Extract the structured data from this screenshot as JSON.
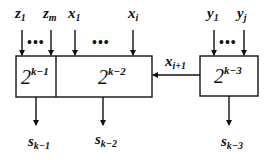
{
  "diagram": {
    "inputs_top": [
      {
        "id": "z1",
        "base": "z",
        "sub": "1"
      },
      {
        "id": "zm",
        "base": "z",
        "sub": "m"
      },
      {
        "id": "x1",
        "base": "x",
        "sub": "1"
      },
      {
        "id": "xi",
        "base": "x",
        "sub": "i"
      },
      {
        "id": "y1",
        "base": "y",
        "sub": "1"
      },
      {
        "id": "yj",
        "base": "y",
        "sub": "j"
      }
    ],
    "ellipsis": "•••",
    "blocks": [
      {
        "id": "block-1",
        "base": "2",
        "exp": "k−1"
      },
      {
        "id": "block-2",
        "base": "2",
        "exp": "k−2"
      },
      {
        "id": "block-3",
        "base": "2",
        "exp": "k−3"
      }
    ],
    "carry": {
      "base": "x",
      "sub": "i+1"
    },
    "outputs": [
      {
        "id": "s-k-1",
        "base": "s",
        "sub": "k−1"
      },
      {
        "id": "s-k-2",
        "base": "s",
        "sub": "k−2"
      },
      {
        "id": "s-k-3",
        "base": "s",
        "sub": "k−3"
      }
    ],
    "colors": {
      "stroke": "#111111",
      "background": "#ffffff"
    }
  }
}
